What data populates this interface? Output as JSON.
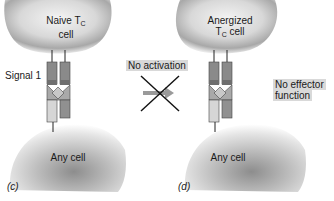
{
  "panels": [
    {
      "id": "c",
      "panel_label": "(c)",
      "top_cell": {
        "name_main": "Naive T",
        "name_sub": "C",
        "name_line2": "cell"
      },
      "bottom_cell": {
        "name": "Any cell"
      },
      "signal_label": "Signal 1"
    },
    {
      "id": "d",
      "panel_label": "(d)",
      "top_cell": {
        "name_line1": "Anergized",
        "name_main": "T",
        "name_sub": "C",
        "name_line2": " cell"
      },
      "bottom_cell": {
        "name": "Any cell"
      },
      "outcome_label_line1": "No effector",
      "outcome_label_line2": "function"
    }
  ],
  "transition": {
    "label": "No activation",
    "arrow_icon": "right-arrow-icon",
    "cross_icon": "x-cross-icon"
  },
  "colors": {
    "receptor_dark": "#8a8a8a",
    "receptor_band": "#6e6e6e",
    "receptor_mid": "#a9a9a9",
    "diamond": "#c8c8c8",
    "receptor_light": "#d6d6d6",
    "arrow": "#9a9a9a",
    "label_highlight": "#d9d9d9"
  }
}
